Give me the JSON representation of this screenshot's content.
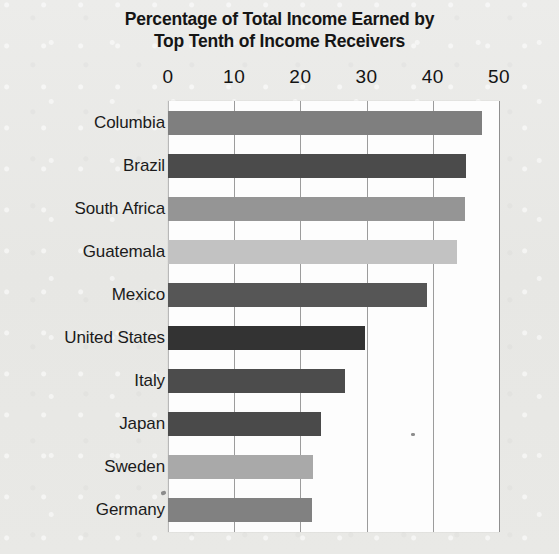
{
  "figure": {
    "background_color": "#e9e9e6",
    "plot_background_color": "#fdfdfd",
    "gridline_color": "#9c9c9c",
    "title_line_1": "Percentage of Total Income Earned by",
    "title_line_2": "Top Tenth of Income Receivers"
  },
  "chart_data": {
    "type": "bar",
    "orientation": "horizontal",
    "title": "Percentage of Total Income Earned by Top Tenth of Income Receivers",
    "subtitle": "",
    "xlabel": "",
    "ylabel": "",
    "xlim": [
      0,
      50
    ],
    "ylim": null,
    "grid": true,
    "legend": false,
    "legend_position": "none",
    "xticks": [
      0,
      10,
      20,
      30,
      40,
      50
    ],
    "xtick_labels": [
      "0",
      "10",
      "20",
      "30",
      "40",
      "50"
    ],
    "categories": [
      "Columbia",
      "Brazil",
      "South Africa",
      "Guatemala",
      "Mexico",
      "United States",
      "Italy",
      "Japan",
      "Sweden",
      "Germany"
    ],
    "values": [
      47.4,
      45.0,
      44.8,
      43.6,
      39.1,
      29.8,
      26.8,
      23.1,
      21.9,
      21.7
    ],
    "bar_colors": [
      "#7f7f7f",
      "#4b4b4b",
      "#959595",
      "#c2c2c2",
      "#565656",
      "#333333",
      "#4c4c4c",
      "#4a4a4a",
      "#a9a9a9",
      "#818181"
    ]
  }
}
